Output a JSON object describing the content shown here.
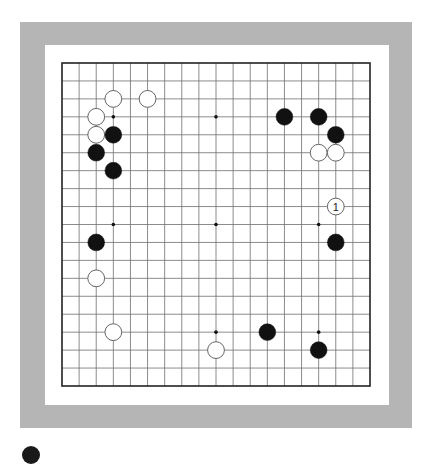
{
  "board": {
    "size": 19,
    "frame_color": "#b5b5b5",
    "board_color": "#ffffff",
    "line_color": "#6e6e6e",
    "border_color": "#222222",
    "hoshi": [
      [
        3,
        3
      ],
      [
        9,
        3
      ],
      [
        15,
        3
      ],
      [
        3,
        9
      ],
      [
        9,
        9
      ],
      [
        15,
        9
      ],
      [
        3,
        15
      ],
      [
        9,
        15
      ],
      [
        15,
        15
      ]
    ],
    "stones": [
      {
        "color": "white",
        "col": 3,
        "row": 2,
        "label": ""
      },
      {
        "color": "white",
        "col": 5,
        "row": 2,
        "label": ""
      },
      {
        "color": "white",
        "col": 2,
        "row": 3,
        "label": ""
      },
      {
        "color": "white",
        "col": 2,
        "row": 4,
        "label": ""
      },
      {
        "color": "black",
        "col": 3,
        "row": 4,
        "label": ""
      },
      {
        "color": "black",
        "col": 2,
        "row": 5,
        "label": ""
      },
      {
        "color": "black",
        "col": 3,
        "row": 6,
        "label": ""
      },
      {
        "color": "black",
        "col": 13,
        "row": 3,
        "label": ""
      },
      {
        "color": "black",
        "col": 15,
        "row": 3,
        "label": ""
      },
      {
        "color": "black",
        "col": 16,
        "row": 4,
        "label": ""
      },
      {
        "color": "white",
        "col": 15,
        "row": 5,
        "label": ""
      },
      {
        "color": "white",
        "col": 16,
        "row": 5,
        "label": ""
      },
      {
        "color": "white",
        "col": 16,
        "row": 8,
        "label": "1"
      },
      {
        "color": "black",
        "col": 16,
        "row": 10,
        "label": ""
      },
      {
        "color": "black",
        "col": 2,
        "row": 10,
        "label": ""
      },
      {
        "color": "white",
        "col": 2,
        "row": 12,
        "label": ""
      },
      {
        "color": "white",
        "col": 3,
        "row": 15,
        "label": ""
      },
      {
        "color": "black",
        "col": 12,
        "row": 15,
        "label": ""
      },
      {
        "color": "white",
        "col": 9,
        "row": 16,
        "label": ""
      },
      {
        "color": "black",
        "col": 15,
        "row": 16,
        "label": ""
      }
    ]
  }
}
